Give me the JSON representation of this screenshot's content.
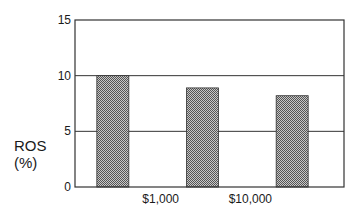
{
  "chart_data": {
    "type": "bar",
    "title": "",
    "xlabel": "",
    "ylabel": "ROS (%)",
    "ylabel_lines": [
      "ROS",
      "(%)"
    ],
    "categories": [
      "< $1,000",
      "$1,000 – $10,000",
      "> $10,000"
    ],
    "x_tick_labels": [
      "$1,000",
      "$10,000"
    ],
    "x_tick_label_position": "between bars",
    "values": [
      10.0,
      8.9,
      8.2
    ],
    "ylim": [
      0,
      15
    ],
    "y_ticks": [
      0,
      5,
      10,
      15
    ],
    "grid": {
      "horizontal": [
        5,
        10
      ],
      "vertical": false
    },
    "legend": null,
    "bar_fill": "stippled gray",
    "colors": {
      "bar": "#9a9a9a",
      "axis": "#333333",
      "grid": "#333333"
    }
  }
}
